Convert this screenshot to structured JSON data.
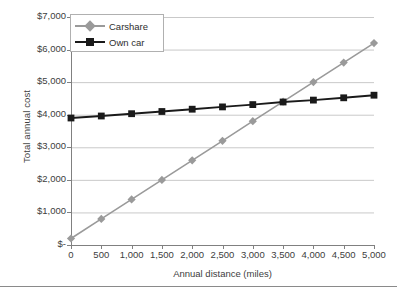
{
  "chart_data": {
    "type": "line",
    "title": "",
    "xlabel": "Annual distance (miles)",
    "ylabel": "Total annual cost",
    "xlim": [
      0,
      5000
    ],
    "ylim": [
      0,
      7000
    ],
    "grid": true,
    "legend_position": "top-left-inside",
    "x": [
      0,
      500,
      1000,
      1500,
      2000,
      2500,
      3000,
      3500,
      4000,
      4500,
      5000
    ],
    "xticklabels": [
      "0",
      "500",
      "1,000",
      "1,500",
      "2,000",
      "2,500",
      "3,000",
      "3,500",
      "4,000",
      "4,500",
      "5,000"
    ],
    "yticks": [
      0,
      1000,
      2000,
      3000,
      4000,
      5000,
      6000,
      7000
    ],
    "yticklabels": [
      "$-",
      "$1,000",
      "$2,000",
      "$3,000",
      "$4,000",
      "$5,000",
      "$6,000",
      "$7,000"
    ],
    "series": [
      {
        "name": "Carshare",
        "color": "#9a9a9a",
        "marker": "diamond",
        "values": [
          200,
          800,
          1400,
          2000,
          2600,
          3200,
          3800,
          4400,
          5000,
          5600,
          6200
        ]
      },
      {
        "name": "Own car",
        "color": "#1a1a1a",
        "marker": "square",
        "values": [
          3900,
          3960,
          4030,
          4100,
          4170,
          4240,
          4310,
          4390,
          4450,
          4520,
          4600
        ]
      }
    ],
    "annotations": []
  },
  "legend": {
    "items": [
      {
        "label": "Carshare"
      },
      {
        "label": "Own car"
      }
    ]
  },
  "colors": {
    "carshare": "#9a9a9a",
    "own_car": "#1a1a1a",
    "grid": "#c9c9c9",
    "axis": "#808080",
    "text": "#404040"
  }
}
